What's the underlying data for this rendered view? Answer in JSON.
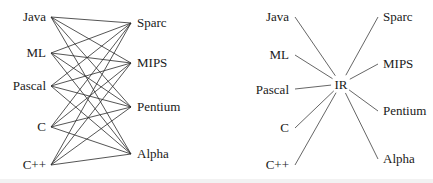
{
  "left_diagram": {
    "title": "",
    "sources": [
      {
        "label": "Java",
        "x": 51,
        "y": 17
      },
      {
        "label": "ML",
        "x": 51,
        "y": 53
      },
      {
        "label": "Pascal",
        "x": 51,
        "y": 86
      },
      {
        "label": "C",
        "x": 51,
        "y": 127
      },
      {
        "label": "C++",
        "x": 51,
        "y": 165
      }
    ],
    "targets": [
      {
        "label": "Sparc",
        "x": 131,
        "y": 23
      },
      {
        "label": "MIPS",
        "x": 131,
        "y": 63
      },
      {
        "label": "Pentium",
        "x": 131,
        "y": 107
      },
      {
        "label": "Alpha",
        "x": 131,
        "y": 154
      }
    ],
    "connectivity": "complete-bipartite"
  },
  "right_diagram": {
    "hub": {
      "label": "IR",
      "x": 341,
      "y": 85
    },
    "sources": [
      {
        "label": "Java",
        "x": 295,
        "y": 17
      },
      {
        "label": "ML",
        "x": 295,
        "y": 55
      },
      {
        "label": "Pascal",
        "x": 295,
        "y": 89
      },
      {
        "label": "C",
        "x": 295,
        "y": 128
      },
      {
        "label": "C++",
        "x": 295,
        "y": 165
      }
    ],
    "targets": [
      {
        "label": "Sparc",
        "x": 378,
        "y": 17
      },
      {
        "label": "MIPS",
        "x": 378,
        "y": 64
      },
      {
        "label": "Pentium",
        "x": 378,
        "y": 111
      },
      {
        "label": "Alpha",
        "x": 378,
        "y": 159
      }
    ]
  },
  "colors": {
    "line": "#2a2a2a",
    "spoke": "#555555",
    "text": "#1a1a1a",
    "background": "#ffffff"
  }
}
